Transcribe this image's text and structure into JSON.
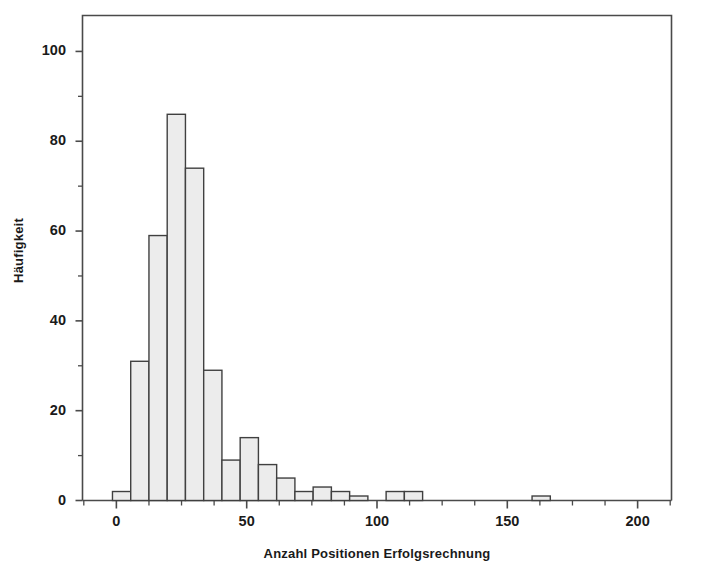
{
  "figure": {
    "background_color": "#ffffff",
    "frame_color": "#4a4a4a",
    "bar_fill_color": "#ececec",
    "bar_edge_color": "#404040",
    "text_color": "#1a1a1a"
  },
  "chart_data": {
    "type": "bar",
    "subtype": "histogram",
    "title": "",
    "subtitle": "",
    "xlabel": "Anzahl Positionen Erfolgsrechnung",
    "ylabel": "Häufigkeit",
    "xlim": [
      -13,
      213
    ],
    "ylim": [
      0,
      108
    ],
    "grid": false,
    "legend": null,
    "xticks": [
      0,
      50,
      100,
      150,
      200
    ],
    "xtick_labels": [
      "0",
      "50",
      "100",
      "150",
      "200"
    ],
    "xminor_ticks": [
      -12.5,
      12.5,
      25,
      37.5,
      62.5,
      75,
      87.5,
      112.5,
      125,
      137.5,
      162.5,
      175,
      187.5,
      212.5
    ],
    "yticks": [
      0,
      20,
      40,
      60,
      80,
      100
    ],
    "ytick_labels": [
      "0",
      "20",
      "40",
      "60",
      "80",
      "100"
    ],
    "yminor_ticks": [
      10,
      30,
      50,
      70,
      90
    ],
    "bin_width": 7,
    "bin_starts": [
      -1.5,
      5.5,
      12.5,
      19.5,
      26.5,
      33.5,
      40.5,
      47.5,
      54.5,
      61.5,
      68.5,
      75.5,
      82.5,
      89.5,
      96.5,
      103.5,
      110.5,
      117.5,
      124.5,
      131.5,
      138.5,
      145.5,
      152.5,
      159.5
    ],
    "categories": [
      "-1.5–5.5",
      "5.5–12.5",
      "12.5–19.5",
      "19.5–26.5",
      "26.5–33.5",
      "33.5–40.5",
      "40.5–47.5",
      "47.5–54.5",
      "54.5–61.5",
      "61.5–68.5",
      "68.5–75.5",
      "75.5–82.5",
      "82.5–89.5",
      "89.5–96.5",
      "96.5–103.5",
      "103.5–110.5",
      "110.5–117.5",
      "117.5–124.5",
      "124.5–131.5",
      "131.5–138.5",
      "138.5–145.5",
      "145.5–152.5",
      "152.5–159.5",
      "159.5–166.5"
    ],
    "values": [
      2,
      31,
      59,
      86,
      74,
      29,
      9,
      14,
      8,
      5,
      2,
      3,
      2,
      1,
      0,
      2,
      2,
      0,
      0,
      0,
      0,
      0,
      0,
      1
    ],
    "max_value": 86,
    "total_count": 322
  },
  "caption": {
    "text": ""
  }
}
